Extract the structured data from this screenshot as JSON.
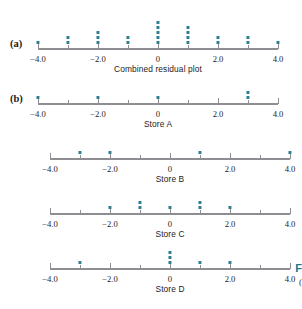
{
  "figure": {
    "panel_tags": [
      "(a)",
      "(b)"
    ],
    "caption_fragment_bold": "F",
    "caption_fragment_plain": "(",
    "dot_color": "#2e7f92",
    "axis_color": "#8e8d91",
    "tick_labels": [
      "-4.0",
      "-2.0",
      "0",
      "2.0",
      "4.0"
    ],
    "tick_values": [
      -4,
      -2,
      0,
      2,
      4
    ]
  },
  "chart_data": [
    {
      "type": "dotplot",
      "title": "Combined residual plot",
      "xlabel": "",
      "ylabel": "",
      "xlim": [
        -4,
        4
      ],
      "xticks": [
        -4,
        -3,
        -2,
        -1,
        0,
        1,
        2,
        3,
        4
      ],
      "xticklabels": [
        "-4.0",
        "",
        "-2.0",
        "",
        "0",
        "",
        "2.0",
        "",
        "4.0"
      ],
      "grid": false,
      "values": [
        -4,
        -3,
        -3,
        -2,
        -2,
        -2,
        -1,
        -1,
        0,
        0,
        0,
        0,
        0,
        1,
        1,
        1,
        1,
        2,
        2,
        3,
        3,
        4
      ],
      "stacks": [
        {
          "x": -4,
          "count": 1
        },
        {
          "x": -3,
          "count": 2
        },
        {
          "x": -2,
          "count": 3
        },
        {
          "x": -1,
          "count": 2
        },
        {
          "x": 0,
          "count": 5
        },
        {
          "x": 1,
          "count": 4
        },
        {
          "x": 2,
          "count": 2
        },
        {
          "x": 3,
          "count": 2
        },
        {
          "x": 4,
          "count": 1
        }
      ]
    },
    {
      "type": "dotplot",
      "title": "Store A",
      "xlabel": "",
      "ylabel": "",
      "xlim": [
        -4,
        4
      ],
      "xticks": [
        -4,
        -3,
        -2,
        -1,
        0,
        1,
        2,
        3,
        4
      ],
      "xticklabels": [
        "-4.0",
        "",
        "-2.0",
        "",
        "0",
        "",
        "2.0",
        "",
        "4.0"
      ],
      "grid": false,
      "values": [
        -4,
        -2,
        0,
        3,
        3
      ],
      "stacks": [
        {
          "x": -4,
          "count": 1
        },
        {
          "x": -2,
          "count": 1
        },
        {
          "x": 0,
          "count": 1
        },
        {
          "x": 3,
          "count": 2
        }
      ]
    },
    {
      "type": "dotplot",
      "title": "Store B",
      "xlabel": "",
      "ylabel": "",
      "xlim": [
        -4,
        4
      ],
      "xticks": [
        -4,
        -3,
        -2,
        -1,
        0,
        1,
        2,
        3,
        4
      ],
      "xticklabels": [
        "-4.0",
        "",
        "-2.0",
        "",
        "0",
        "",
        "2.0",
        "",
        "4.0"
      ],
      "grid": false,
      "values": [
        -3,
        -2,
        1,
        4
      ],
      "stacks": [
        {
          "x": -3,
          "count": 1
        },
        {
          "x": -2,
          "count": 1
        },
        {
          "x": 1,
          "count": 1
        },
        {
          "x": 4,
          "count": 1
        }
      ]
    },
    {
      "type": "dotplot",
      "title": "Store C",
      "xlabel": "",
      "ylabel": "",
      "xlim": [
        -4,
        4
      ],
      "xticks": [
        -4,
        -3,
        -2,
        -1,
        0,
        1,
        2,
        3,
        4
      ],
      "xticklabels": [
        "-4.0",
        "",
        "-2.0",
        "",
        "0",
        "",
        "2.0",
        "",
        "4.0"
      ],
      "grid": false,
      "values": [
        -2,
        -1,
        -1,
        0,
        1,
        1,
        2
      ],
      "stacks": [
        {
          "x": -2,
          "count": 1
        },
        {
          "x": -1,
          "count": 2
        },
        {
          "x": 0,
          "count": 1
        },
        {
          "x": 1,
          "count": 2
        },
        {
          "x": 2,
          "count": 1
        }
      ]
    },
    {
      "type": "dotplot",
      "title": "Store D",
      "xlabel": "",
      "ylabel": "",
      "xlim": [
        -4,
        4
      ],
      "xticks": [
        -4,
        -3,
        -2,
        -1,
        0,
        1,
        2,
        3,
        4
      ],
      "xticklabels": [
        "-4.0",
        "",
        "-2.0",
        "",
        "0",
        "",
        "2.0",
        "",
        "4.0"
      ],
      "grid": false,
      "values": [
        -3,
        0,
        0,
        0,
        1,
        2
      ],
      "stacks": [
        {
          "x": -3,
          "count": 1
        },
        {
          "x": 0,
          "count": 3
        },
        {
          "x": 1,
          "count": 1
        },
        {
          "x": 2,
          "count": 1
        }
      ]
    }
  ]
}
